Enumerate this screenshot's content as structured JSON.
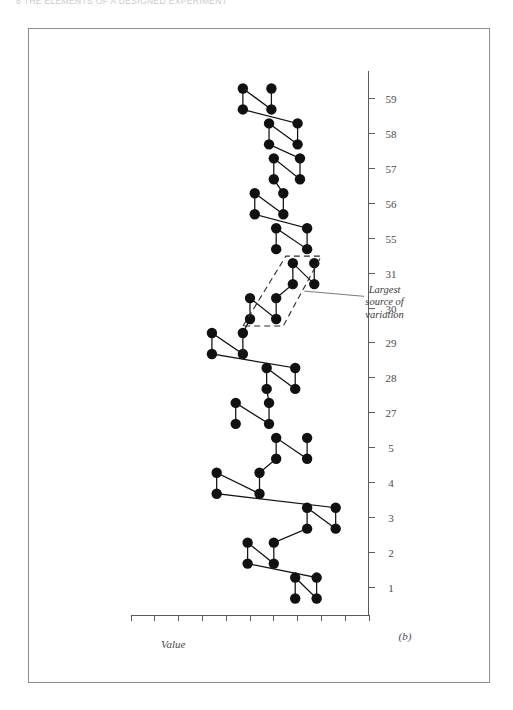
{
  "running_head": {
    "text": "8    THE ELEMENTS OF A DESIGNED EXPERIMENT"
  },
  "figure": {
    "panel_caption": "(b)",
    "value_axis_label": "Value",
    "annotation": {
      "line1": "Largest",
      "line2": "source of",
      "line3": "variation"
    }
  },
  "colors": {
    "frame": "#8d8d93",
    "axis": "#5a5a60",
    "ink": "#111111",
    "label": "#4a4a50",
    "dashed": "#2b2b2b"
  },
  "chart_data": {
    "type": "line",
    "title": "",
    "subtitle": "",
    "xlabel": "",
    "ylabel": "Value",
    "grid": false,
    "legend": "none",
    "orientation": "rotated-90-ccw",
    "note": "Each sample number carries a pair of observations joined by a short horizontal segment; the pair midpoints are joined by the connecting run line.",
    "ylim": [
      0,
      10
    ],
    "yticks": [
      0,
      1,
      2,
      3,
      4,
      5,
      6,
      7,
      8,
      9,
      10
    ],
    "categories": [
      "1",
      "2",
      "3",
      "4",
      "5",
      "27",
      "28",
      "29",
      "30",
      "31",
      "55",
      "56",
      "57",
      "58",
      "59"
    ],
    "groups": [
      {
        "name": "Group 1",
        "categories": [
          "1",
          "2",
          "3",
          "4",
          "5"
        ],
        "pairs": [
          {
            "x": "1",
            "low": 2.2,
            "high": 3.1
          },
          {
            "x": "2",
            "low": 4.0,
            "high": 5.1
          },
          {
            "x": "3",
            "low": 1.4,
            "high": 2.6
          },
          {
            "x": "4",
            "low": 4.6,
            "high": 6.4
          },
          {
            "x": "5",
            "low": 2.6,
            "high": 3.9
          }
        ]
      },
      {
        "name": "Group 2",
        "categories": [
          "27",
          "28",
          "29",
          "30",
          "31"
        ],
        "pairs": [
          {
            "x": "27",
            "low": 4.2,
            "high": 5.6
          },
          {
            "x": "28",
            "low": 3.1,
            "high": 4.3
          },
          {
            "x": "29",
            "low": 5.3,
            "high": 6.6
          },
          {
            "x": "30",
            "low": 3.9,
            "high": 5.0
          },
          {
            "x": "31",
            "low": 2.3,
            "high": 3.2
          }
        ]
      },
      {
        "name": "Group 3",
        "categories": [
          "55",
          "56",
          "57",
          "58",
          "59"
        ],
        "pairs": [
          {
            "x": "55",
            "low": 2.6,
            "high": 3.9
          },
          {
            "x": "56",
            "low": 3.6,
            "high": 4.8
          },
          {
            "x": "57",
            "low": 2.9,
            "high": 4.0
          },
          {
            "x": "58",
            "low": 3.0,
            "high": 4.2
          },
          {
            "x": "59",
            "low": 4.1,
            "high": 5.3
          }
        ]
      }
    ],
    "annotations": [
      {
        "text": "Largest source of variation",
        "target_categories": [
          "30",
          "31"
        ],
        "marker": "dashed-lasso"
      }
    ]
  }
}
